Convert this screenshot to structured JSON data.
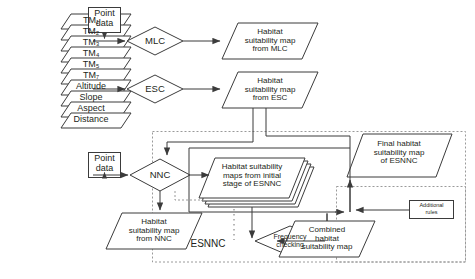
{
  "diagram": {
    "stroke_color": "#3b3b3b",
    "dashed_color": "#9a9a9a",
    "text_color": "#231f20",
    "background": "#ffffff"
  },
  "input_layers": {
    "name": "input-data-stack",
    "items": [
      {
        "label": "TM₁"
      },
      {
        "label": "TM₂"
      },
      {
        "label": "TM₃"
      },
      {
        "label": "TM₄"
      },
      {
        "label": "TM₅"
      },
      {
        "label": "TM₇"
      },
      {
        "label": "Altitude"
      },
      {
        "label": "Slope"
      },
      {
        "label": "Aspect"
      },
      {
        "label": "Distance"
      }
    ]
  },
  "point_data": {
    "top": "Point\ndata",
    "top_line1": "Point",
    "top_line2": "data",
    "bottom_line1": "Point",
    "bottom_line2": "data"
  },
  "classifiers": {
    "mlc": "MLC",
    "esc": "ESC",
    "nnc": "NNC",
    "frequency_checking": "Frequency\nchecking",
    "frequency_line1": "Frequency",
    "frequency_line2": "checking"
  },
  "outputs": {
    "mlc_map_line1": "Habitat",
    "mlc_map_line2": "suitability map",
    "mlc_map_line3": "from MLC",
    "esc_map_line1": "Habitat",
    "esc_map_line2": "suitability map",
    "esc_map_line3": "from ESC",
    "nnc_map_line1": "Habitat",
    "nnc_map_line2": "suitability map",
    "nnc_map_line3": "from NNC",
    "initial_maps_line1": "Habitat suitability",
    "initial_maps_line2": "maps from initial",
    "initial_maps_line3": "stage of ESNNC",
    "combined_line1": "Combined",
    "combined_line2": "habitat",
    "combined_line3": "suitability map",
    "final_line1": "Final habitat",
    "final_line2": "suitability map",
    "final_line3": "of ESNNC"
  },
  "groups": {
    "esnnc_label": "ESNNC",
    "additional_rules_line1": "Additional",
    "additional_rules_line2": "rules"
  }
}
